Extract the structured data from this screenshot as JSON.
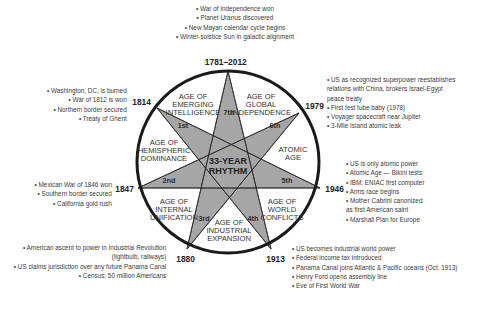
{
  "diagram": {
    "center_label": [
      "33-YEAR",
      "RHYTHM"
    ],
    "colors": {
      "star_fill": "#a6a6a6",
      "circle_stroke": "#1a1a1a",
      "background": "#ffffff",
      "text": "#333333"
    },
    "years": {
      "top": "1781–2012",
      "y1814": "1814",
      "y1979": "1979",
      "y1847": "1847",
      "y1946": "1946",
      "y1880": "1880",
      "y1913": "1913"
    },
    "ages": [
      {
        "ordinal": "1st",
        "lines": [
          "AGE OF",
          "EMERGING",
          "INTELLIGENCE"
        ]
      },
      {
        "ordinal": "2nd",
        "lines": [
          "AGE OF",
          "HEMISPHERIC",
          "DOMINANCE"
        ]
      },
      {
        "ordinal": "3rd",
        "lines": [
          "AGE OF",
          "INTERNAL",
          "UNIFICATION"
        ]
      },
      {
        "ordinal": "4th",
        "lines": [
          "AGE OF",
          "INDUSTRIAL",
          "EXPANSION"
        ]
      },
      {
        "ordinal": "5th",
        "lines": [
          "AGE OF",
          "WORLD",
          "CONFLICTS"
        ]
      },
      {
        "ordinal": "6th",
        "lines": [
          "ATOMIC",
          "AGE"
        ]
      },
      {
        "ordinal": "7th",
        "lines": [
          "AGE OF",
          "GLOBAL",
          "INDEPENDENCE"
        ]
      }
    ],
    "events": {
      "top": [
        "• War of Independence won",
        "• Planet Uranus discovered",
        "• New Mayan calendar cycle begins",
        "• Winter-solstice Sun in galactic alignment"
      ],
      "y1814": [
        "• Washington, DC, is burned",
        "• War of 1812 is won",
        "• Northern border secured",
        "• Treaty of Ghent"
      ],
      "y1979": [
        "• US as recognized superpower reestablishes",
        "relations with China, brokers Israel-Egypt",
        "peace treaty",
        "• First test tube baby (1978)",
        "• Voyager spacecraft near Jupiter",
        "• 3-Mile Island atomic leak"
      ],
      "y1847": [
        "• Mexican War of 1846 won",
        "• Southern border secured",
        "• California gold rush"
      ],
      "y1946": [
        "• US is only atomic power",
        "• Atomic Age — Bikini tests",
        "• IBM: ENIAC first computer",
        "• Arms race begins",
        "• Mother Cabrini canonized",
        "as first American saint",
        "• Marshall Plan for Europe"
      ],
      "y1880": [
        "• American ascent to power in Industrial Revolution",
        "(lightbulb, railways)",
        "• US claims jurisdiction over any future Panama Canal",
        "• Census: 50 million Americans"
      ],
      "y1913": [
        "• US becomes industrial world power",
        "• Federal income tax introduced",
        "• Panama Canal joins Atlantic & Pacific oceans (Oct. 1913)",
        "• Henry Ford opens assembly line",
        "• Eve of First World War"
      ]
    }
  }
}
